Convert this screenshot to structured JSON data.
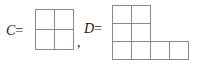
{
  "figure": {
    "type": "young-diagram-pair",
    "background_color": "#ffffff",
    "line_color": "#8a8a8a",
    "text_color": "#1a1a1a",
    "items": [
      {
        "name": "C",
        "label": "C =",
        "row_lengths": [
          2,
          2
        ],
        "total_cells": 4
      },
      {
        "name": "D",
        "label": "D =",
        "row_lengths": [
          2,
          2,
          4
        ],
        "total_cells": 8
      }
    ],
    "separator": ","
  },
  "labels": {
    "c_variable": "C",
    "c_equals": "=",
    "comma": ",",
    "d_variable": "D",
    "d_equals": "="
  }
}
